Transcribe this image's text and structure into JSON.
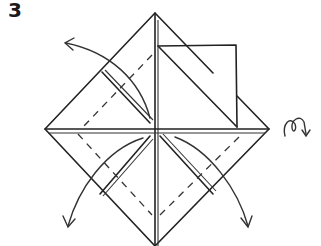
{
  "diagram": {
    "step_number": "3",
    "symbols": [
      {
        "name": "fold-arrow-upper-left",
        "meaning": "valley fold flap outward"
      },
      {
        "name": "fold-arrow-lower-left",
        "meaning": "valley fold flap outward"
      },
      {
        "name": "fold-arrow-lower-right",
        "meaning": "valley fold flap outward"
      },
      {
        "name": "turn-over-symbol",
        "meaning": "turn model over"
      }
    ],
    "colors": {
      "ink": "#222222",
      "paper": "#ffffff"
    }
  }
}
